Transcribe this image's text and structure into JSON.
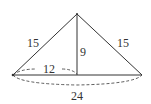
{
  "diagram": {
    "type": "isosceles-triangle-with-altitude",
    "colors": {
      "stroke": "#333333",
      "background": "#ffffff"
    },
    "labels": {
      "left_side": "15",
      "right_side": "15",
      "altitude": "9",
      "half_base": "12",
      "base": "24"
    }
  }
}
